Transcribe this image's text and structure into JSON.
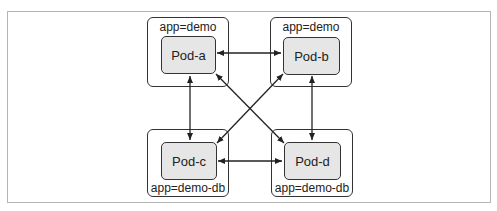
{
  "diagram": {
    "groups": [
      {
        "id": "a",
        "label": "app=demo",
        "pod": "Pod-a"
      },
      {
        "id": "b",
        "label": "app=demo",
        "pod": "Pod-b"
      },
      {
        "id": "c",
        "label": "app=demo-db",
        "pod": "Pod-c"
      },
      {
        "id": "d",
        "label": "app=demo-db",
        "pod": "Pod-d"
      }
    ],
    "connections": [
      {
        "from": "Pod-a",
        "to": "Pod-b",
        "bidirectional": true
      },
      {
        "from": "Pod-a",
        "to": "Pod-c",
        "bidirectional": true
      },
      {
        "from": "Pod-b",
        "to": "Pod-d",
        "bidirectional": true
      },
      {
        "from": "Pod-c",
        "to": "Pod-d",
        "bidirectional": true
      },
      {
        "from": "Pod-a",
        "to": "Pod-d",
        "bidirectional": true
      },
      {
        "from": "Pod-b",
        "to": "Pod-c",
        "bidirectional": true
      }
    ]
  }
}
